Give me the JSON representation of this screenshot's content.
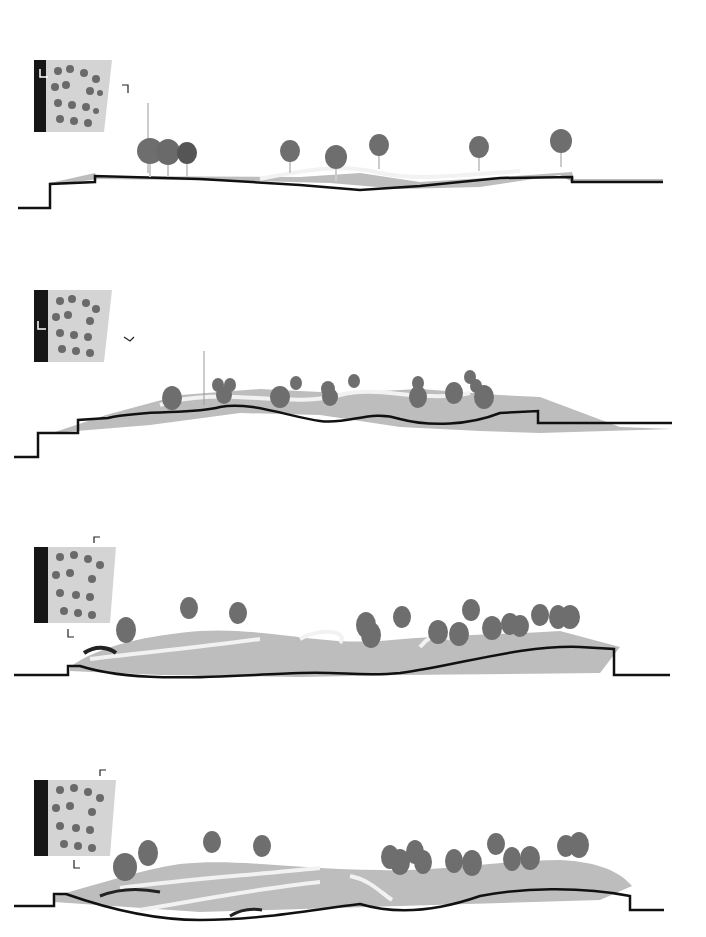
{
  "page": {
    "title": "",
    "background": "#ffffff"
  },
  "colors": {
    "ground_line": "#111111",
    "terrain_fill": "#bdbdbd",
    "terrain_light": "#d9d9d9",
    "path_white": "#f2f2f2",
    "shadow": "#8e8e8e",
    "tree_canopy": "#6e6e6e",
    "tree_dark": "#4a4a4a",
    "plan_black": "#161616",
    "plan_fill": "#cfcfcf"
  },
  "sections": [
    {
      "id": 1,
      "top": 55,
      "keyplan_cut": "A",
      "tree_count": 8,
      "description": "Section A - flat terrain with pavilions"
    },
    {
      "id": 2,
      "top": 285,
      "keyplan_cut": "B",
      "tree_count": 17,
      "description": "Section B - undulating terrain"
    },
    {
      "id": 3,
      "top": 535,
      "keyplan_cut": "C",
      "tree_count": 16,
      "description": "Section C - hill terrain"
    },
    {
      "id": 4,
      "top": 760,
      "keyplan_cut": "D",
      "tree_count": 20,
      "description": "Section D - hill terrain with dense grove"
    }
  ]
}
